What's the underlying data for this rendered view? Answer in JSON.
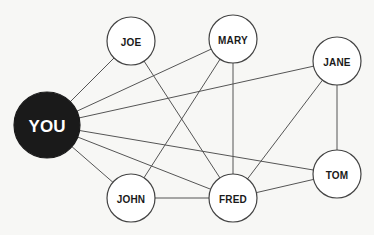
{
  "diagram": {
    "type": "social-network-graph",
    "nodes": [
      {
        "id": "you",
        "label": "YOU",
        "x": 47,
        "y": 125,
        "r": 33,
        "primary": true
      },
      {
        "id": "joe",
        "label": "JOE",
        "x": 131,
        "y": 41,
        "r": 24,
        "primary": false
      },
      {
        "id": "mary",
        "label": "MARY",
        "x": 233,
        "y": 39,
        "r": 24,
        "primary": false
      },
      {
        "id": "jane",
        "label": "JANE",
        "x": 337,
        "y": 61,
        "r": 24,
        "primary": false
      },
      {
        "id": "john",
        "label": "JOHN",
        "x": 131,
        "y": 198,
        "r": 24,
        "primary": false
      },
      {
        "id": "fred",
        "label": "FRED",
        "x": 233,
        "y": 198,
        "r": 24,
        "primary": false
      },
      {
        "id": "tom",
        "label": "TOM",
        "x": 337,
        "y": 174,
        "r": 24,
        "primary": false
      }
    ],
    "edges": [
      [
        "you",
        "joe"
      ],
      [
        "you",
        "mary"
      ],
      [
        "you",
        "jane"
      ],
      [
        "you",
        "tom"
      ],
      [
        "you",
        "fred"
      ],
      [
        "you",
        "john"
      ],
      [
        "joe",
        "fred"
      ],
      [
        "mary",
        "john"
      ],
      [
        "mary",
        "fred"
      ],
      [
        "jane",
        "fred"
      ],
      [
        "jane",
        "tom"
      ],
      [
        "john",
        "fred"
      ],
      [
        "fred",
        "tom"
      ]
    ],
    "colors": {
      "background": "#f7f7f5",
      "primary_node_fill": "#1a1a1a",
      "node_fill": "#ffffff",
      "node_stroke": "#444444",
      "edge_stroke": "#555555"
    }
  }
}
